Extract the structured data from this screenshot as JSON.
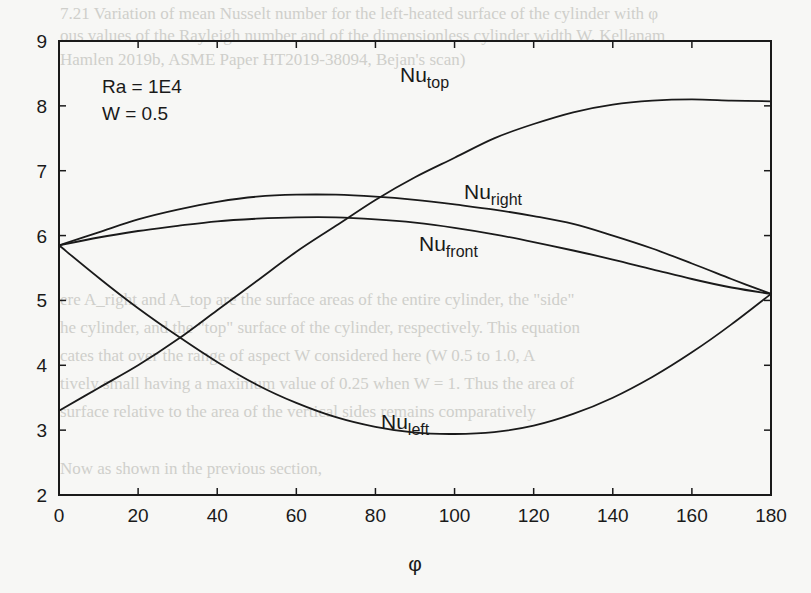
{
  "chart_data": {
    "type": "line",
    "title": "",
    "xlabel": "φ",
    "ylabel": "",
    "xlim": [
      0,
      180
    ],
    "ylim": [
      2,
      9
    ],
    "grid": false,
    "legend": "inline labels",
    "x_ticks": [
      0,
      20,
      40,
      60,
      80,
      100,
      120,
      140,
      160,
      180
    ],
    "y_ticks": [
      2,
      3,
      4,
      5,
      6,
      7,
      8,
      9
    ],
    "annotations": [
      "Ra = 1E4",
      "W = 0.5"
    ],
    "x": [
      0,
      10,
      20,
      30,
      40,
      50,
      60,
      70,
      80,
      90,
      100,
      110,
      120,
      130,
      140,
      150,
      160,
      170,
      180
    ],
    "series": [
      {
        "name": "Nu_top",
        "label_main": "Nu",
        "label_sub": "top",
        "values": [
          3.3,
          3.65,
          4.0,
          4.4,
          4.85,
          5.3,
          5.75,
          6.15,
          6.55,
          6.9,
          7.2,
          7.5,
          7.72,
          7.9,
          8.02,
          8.08,
          8.1,
          8.08,
          8.07
        ]
      },
      {
        "name": "Nu_right",
        "label_main": "Nu",
        "label_sub": "right",
        "values": [
          5.85,
          6.05,
          6.25,
          6.4,
          6.52,
          6.6,
          6.63,
          6.63,
          6.6,
          6.55,
          6.48,
          6.4,
          6.3,
          6.18,
          6.0,
          5.8,
          5.57,
          5.33,
          5.1
        ]
      },
      {
        "name": "Nu_front",
        "label_main": "Nu",
        "label_sub": "front",
        "values": [
          5.85,
          5.97,
          6.07,
          6.15,
          6.22,
          6.26,
          6.28,
          6.28,
          6.25,
          6.2,
          6.12,
          6.02,
          5.9,
          5.77,
          5.63,
          5.48,
          5.33,
          5.2,
          5.1
        ]
      },
      {
        "name": "Nu_left",
        "label_main": "Nu",
        "label_sub": "left",
        "values": [
          5.85,
          5.35,
          4.88,
          4.45,
          4.05,
          3.7,
          3.42,
          3.2,
          3.05,
          2.96,
          2.94,
          2.97,
          3.07,
          3.25,
          3.5,
          3.82,
          4.2,
          4.63,
          5.1
        ]
      }
    ],
    "label_positions": [
      {
        "series": "Nu_top",
        "x": 400,
        "y": 82
      },
      {
        "series": "Nu_right",
        "x": 464,
        "y": 199
      },
      {
        "series": "Nu_front",
        "x": 419,
        "y": 251
      },
      {
        "series": "Nu_left",
        "x": 381,
        "y": 429
      }
    ],
    "line_color": "#1a1a1a"
  },
  "annotations": {
    "ra": "Ra = 1E4",
    "w": "W = 0.5"
  },
  "axes": {
    "xlabel": "φ"
  },
  "bleed_through_text": [
    "7.21 Variation of mean Nusselt number for the left-heated surface of the cylinder with φ",
    "ous values of the Rayleigh number and of the dimensionless cylinder width W. Kellanam",
    "Hamlen 2019b, ASME Paper HT2019-38094, Bejan's scan)",
    "ere A_right and A_top are the surface areas of the entire cylinder, the \"side\"",
    "he cylinder, and the \"top\" surface of the cylinder, respectively. This equation",
    "cates that over the range of aspect W considered here (W 0.5 to 1.0, A",
    "tively small having a maximum value of 0.25 when W = 1. Thus the area of",
    "surface relative to the area of the vertical sides remains comparatively",
    "Now as shown in the previous section,"
  ]
}
